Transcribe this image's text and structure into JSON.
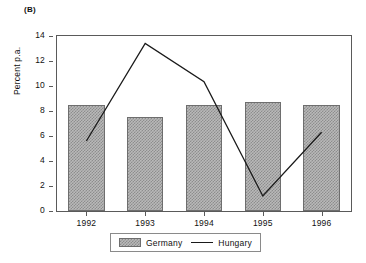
{
  "panel": {
    "label": "(B)"
  },
  "legend": {
    "germany_label": "Germany",
    "hungary_label": "Hungary"
  },
  "axis": {
    "ylabel": "Percent p.a.",
    "yticks": [
      "0",
      "2",
      "4",
      "6",
      "8",
      "10",
      "12",
      "14"
    ],
    "xticks": [
      "1992",
      "1993",
      "1994",
      "1995",
      "1996"
    ]
  },
  "colors": {
    "bar_fill": "#b9b9b9",
    "bar_hatch": "#8d8d8d",
    "bar_edge": "#6e6e6e",
    "line": "#1a1a1a",
    "frame": "#5a5a5a",
    "text": "#111111",
    "background": "#ffffff"
  },
  "chart_data": {
    "type": "bar",
    "title": "(B)",
    "xlabel": "",
    "ylabel": "Percent p.a.",
    "categories": [
      "1992",
      "1993",
      "1994",
      "1995",
      "1996"
    ],
    "ylim": [
      0,
      14
    ],
    "ytick_step": 2,
    "grid": false,
    "legend_position": "bottom",
    "series": [
      {
        "name": "Germany",
        "type": "bar",
        "values": [
          8.5,
          7.5,
          8.5,
          8.7,
          8.5
        ]
      },
      {
        "name": "Hungary",
        "type": "line",
        "values": [
          5.6,
          13.4,
          10.35,
          1.2,
          6.3
        ]
      }
    ]
  }
}
